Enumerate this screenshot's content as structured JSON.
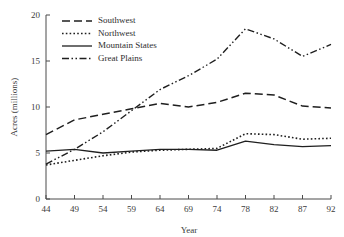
{
  "chart_data": {
    "type": "line",
    "title": "",
    "xlabel": "Year",
    "ylabel": "Acres (millions)",
    "x": [
      44,
      49,
      54,
      59,
      64,
      69,
      74,
      78,
      82,
      87,
      92
    ],
    "xtick_labels": [
      "44",
      "49",
      "54",
      "59",
      "64",
      "69",
      "74",
      "78",
      "82",
      "87",
      "92"
    ],
    "ytick_labels": [
      "0",
      "5",
      "10",
      "15",
      "20"
    ],
    "yticks": [
      0,
      5,
      10,
      15,
      20
    ],
    "xlim": [
      44,
      92
    ],
    "ylim": [
      0,
      20
    ],
    "grid": false,
    "legend_position": "top-left",
    "series": [
      {
        "name": "Southwest",
        "style": "dashed",
        "values": [
          7.0,
          8.6,
          9.2,
          9.8,
          10.4,
          10.0,
          10.5,
          11.5,
          11.3,
          10.1,
          9.9
        ]
      },
      {
        "name": "Northwest",
        "style": "dotted",
        "values": [
          3.7,
          4.2,
          4.7,
          5.1,
          5.3,
          5.4,
          5.5,
          7.1,
          7.0,
          6.5,
          6.6
        ]
      },
      {
        "name": "Mountain States",
        "style": "solid",
        "values": [
          5.2,
          5.4,
          5.0,
          5.2,
          5.4,
          5.4,
          5.3,
          6.3,
          5.9,
          5.7,
          5.8
        ]
      },
      {
        "name": "Great Plains",
        "style": "dash-dot-dot",
        "values": [
          3.8,
          5.4,
          7.3,
          9.6,
          11.9,
          13.4,
          15.2,
          18.5,
          17.4,
          15.5,
          16.8
        ]
      }
    ]
  },
  "legend": {
    "items": [
      {
        "label": "Southwest"
      },
      {
        "label": "Northwest"
      },
      {
        "label": "Mountain States"
      },
      {
        "label": "Great Plains"
      }
    ]
  },
  "colors": {
    "ink": "#1f1f1f",
    "axis": "#4a4a4a",
    "background": "#ffffff"
  }
}
